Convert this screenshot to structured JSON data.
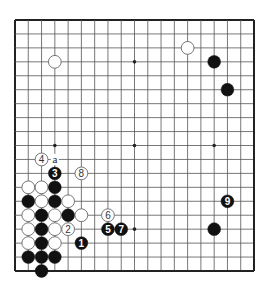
{
  "diagram": {
    "type": "go-board",
    "size": 19,
    "colors": {
      "background": "#ffffff",
      "line": "#555555",
      "frame": "#222222",
      "black": "#111111",
      "white": "#ffffff",
      "white_stroke": "#666666"
    },
    "star_points": [
      [
        3,
        3
      ],
      [
        9,
        3
      ],
      [
        15,
        3
      ],
      [
        3,
        9
      ],
      [
        9,
        9
      ],
      [
        15,
        9
      ],
      [
        3,
        15
      ],
      [
        9,
        15
      ],
      [
        15,
        15
      ]
    ],
    "stones": [
      {
        "c": 3,
        "r": 3,
        "color": "white",
        "label": ""
      },
      {
        "c": 13,
        "r": 2,
        "color": "white",
        "label": ""
      },
      {
        "c": 15,
        "r": 3,
        "color": "black",
        "label": ""
      },
      {
        "c": 16,
        "r": 5,
        "color": "black",
        "label": ""
      },
      {
        "c": 16,
        "r": 13,
        "color": "black",
        "label": "9"
      },
      {
        "c": 15,
        "r": 15,
        "color": "black",
        "label": ""
      },
      {
        "c": 2,
        "r": 10,
        "color": "white",
        "label": "4"
      },
      {
        "c": 3,
        "r": 11,
        "color": "black",
        "label": "3"
      },
      {
        "c": 5,
        "r": 11,
        "color": "white",
        "label": "8"
      },
      {
        "c": 1,
        "r": 12,
        "color": "white",
        "label": ""
      },
      {
        "c": 2,
        "r": 12,
        "color": "white",
        "label": ""
      },
      {
        "c": 3,
        "r": 12,
        "color": "black",
        "label": ""
      },
      {
        "c": 1,
        "r": 13,
        "color": "black",
        "label": ""
      },
      {
        "c": 2,
        "r": 13,
        "color": "white",
        "label": ""
      },
      {
        "c": 3,
        "r": 13,
        "color": "black",
        "label": ""
      },
      {
        "c": 4,
        "r": 13,
        "color": "white",
        "label": ""
      },
      {
        "c": 1,
        "r": 14,
        "color": "white",
        "label": ""
      },
      {
        "c": 2,
        "r": 14,
        "color": "black",
        "label": ""
      },
      {
        "c": 3,
        "r": 14,
        "color": "white",
        "label": ""
      },
      {
        "c": 4,
        "r": 14,
        "color": "black",
        "label": ""
      },
      {
        "c": 5,
        "r": 14,
        "color": "white",
        "label": ""
      },
      {
        "c": 7,
        "r": 14,
        "color": "white",
        "label": "6"
      },
      {
        "c": 1,
        "r": 15,
        "color": "white",
        "label": ""
      },
      {
        "c": 2,
        "r": 15,
        "color": "black",
        "label": ""
      },
      {
        "c": 3,
        "r": 15,
        "color": "white",
        "label": ""
      },
      {
        "c": 4,
        "r": 15,
        "color": "white",
        "label": "2"
      },
      {
        "c": 7,
        "r": 15,
        "color": "black",
        "label": "5"
      },
      {
        "c": 8,
        "r": 15,
        "color": "black",
        "label": "7"
      },
      {
        "c": 1,
        "r": 16,
        "color": "white",
        "label": ""
      },
      {
        "c": 2,
        "r": 16,
        "color": "black",
        "label": ""
      },
      {
        "c": 3,
        "r": 16,
        "color": "white",
        "label": ""
      },
      {
        "c": 5,
        "r": 16,
        "color": "black",
        "label": "1"
      },
      {
        "c": 1,
        "r": 17,
        "color": "black",
        "label": ""
      },
      {
        "c": 2,
        "r": 17,
        "color": "black",
        "label": ""
      },
      {
        "c": 3,
        "r": 17,
        "color": "black",
        "label": ""
      },
      {
        "c": 2,
        "r": 18,
        "color": "black",
        "label": ""
      }
    ],
    "marks": [
      {
        "c": 3,
        "r": 10,
        "text": "a"
      }
    ]
  }
}
